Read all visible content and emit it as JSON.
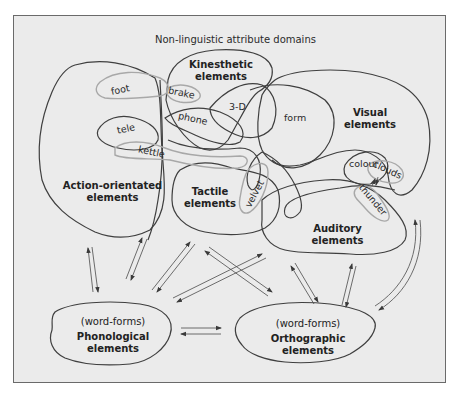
{
  "title": "Non-linguistic attribute domains",
  "domains": {
    "kinesthetic": {
      "line1": "Kinesthetic",
      "line2": "elements"
    },
    "visual": {
      "line1": "Visual",
      "line2": "elements"
    },
    "action": {
      "line1": "Action-orientated",
      "line2": "elements"
    },
    "tactile": {
      "line1": "Tactile",
      "line2": "elements"
    },
    "auditory": {
      "line1": "Auditory",
      "line2": "elements"
    }
  },
  "lexical": {
    "phonological": {
      "sub": "(word-forms)",
      "line1": "Phonological",
      "line2": "elements"
    },
    "orthographic": {
      "sub": "(word-forms)",
      "line1": "Orthographic",
      "line2": "elements"
    }
  },
  "attributes": [
    "foot",
    "brake",
    "3-D",
    "form",
    "phone",
    "tele",
    "kettle",
    "colour",
    "clouds",
    "thunder",
    "velvet"
  ],
  "colors": {
    "background": "#ebebeb",
    "frame": "#6a6a6a",
    "outline": "#3f3f3f",
    "word_loop": "#a8a8a8"
  }
}
